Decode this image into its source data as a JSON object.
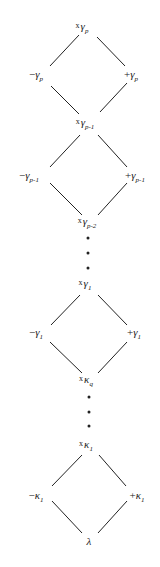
{
  "diagram": {
    "nodes": [
      {
        "id": "x_gamma_p",
        "prefix": "x",
        "symbol": "γ",
        "sub": "p",
        "x": 82,
        "y": 28
      },
      {
        "id": "minus_gamma_p",
        "prefix": "−",
        "symbol": "γ",
        "sub": "p",
        "x": 36,
        "y": 76
      },
      {
        "id": "plus_gamma_p",
        "prefix": "+",
        "symbol": "γ",
        "sub": "p",
        "x": 131,
        "y": 76
      },
      {
        "id": "x_gamma_p-1",
        "prefix": "x",
        "symbol": "γ",
        "sub": "p-1",
        "x": 85,
        "y": 124
      },
      {
        "id": "minus_gamma_p-1",
        "prefix": "−",
        "symbol": "γ",
        "sub": "p-1",
        "x": 29,
        "y": 177
      },
      {
        "id": "plus_gamma_p-1",
        "prefix": "+",
        "symbol": "γ",
        "sub": "p-1",
        "x": 135,
        "y": 177
      },
      {
        "id": "x_gamma_p-2",
        "prefix": "x",
        "symbol": "γ",
        "sub": "p-2",
        "x": 87,
        "y": 223
      },
      {
        "id": "x_gamma_1",
        "prefix": "x",
        "symbol": "γ",
        "sub": "1",
        "x": 85,
        "y": 285
      },
      {
        "id": "minus_gamma_1",
        "prefix": "−",
        "symbol": "γ",
        "sub": "1",
        "x": 36,
        "y": 334
      },
      {
        "id": "plus_gamma_1",
        "prefix": "+",
        "symbol": "γ",
        "sub": "1",
        "x": 134,
        "y": 334
      },
      {
        "id": "x_kappa_q",
        "prefix": "x",
        "symbol": "κ",
        "sub": "q",
        "x": 86,
        "y": 381
      },
      {
        "id": "x_kappa_1",
        "prefix": "x",
        "symbol": "κ",
        "sub": "1",
        "x": 86,
        "y": 446
      },
      {
        "id": "minus_kappa_1",
        "prefix": "−",
        "symbol": "κ",
        "sub": "1",
        "x": 36,
        "y": 497
      },
      {
        "id": "plus_kappa_1",
        "prefix": "+",
        "symbol": "κ",
        "sub": "1",
        "x": 137,
        "y": 497
      },
      {
        "id": "lambda",
        "prefix": "",
        "symbol": "λ",
        "sub": "",
        "x": 89,
        "y": 541
      }
    ],
    "edges": [
      {
        "x1": 79,
        "y1": 35,
        "x2": 50,
        "y2": 66
      },
      {
        "x1": 97,
        "y1": 37,
        "x2": 125,
        "y2": 66
      },
      {
        "x1": 51,
        "y1": 86,
        "x2": 79,
        "y2": 114
      },
      {
        "x1": 127,
        "y1": 83,
        "x2": 100,
        "y2": 112
      },
      {
        "x1": 80,
        "y1": 135,
        "x2": 50,
        "y2": 167
      },
      {
        "x1": 98,
        "y1": 135,
        "x2": 127,
        "y2": 167
      },
      {
        "x1": 50,
        "y1": 183,
        "x2": 82,
        "y2": 215
      },
      {
        "x1": 127,
        "y1": 183,
        "x2": 98,
        "y2": 215
      },
      {
        "x1": 80,
        "y1": 295,
        "x2": 51,
        "y2": 325
      },
      {
        "x1": 98,
        "y1": 295,
        "x2": 127,
        "y2": 325
      },
      {
        "x1": 50,
        "y1": 342,
        "x2": 82,
        "y2": 373
      },
      {
        "x1": 127,
        "y1": 342,
        "x2": 98,
        "y2": 373
      },
      {
        "x1": 82,
        "y1": 455,
        "x2": 52,
        "y2": 486
      },
      {
        "x1": 99,
        "y1": 455,
        "x2": 126,
        "y2": 486
      },
      {
        "x1": 52,
        "y1": 501,
        "x2": 82,
        "y2": 533
      },
      {
        "x1": 127,
        "y1": 501,
        "x2": 98,
        "y2": 533
      }
    ],
    "ellipsis_dots": [
      {
        "x": 88,
        "y": 238
      },
      {
        "x": 88,
        "y": 253
      },
      {
        "x": 88,
        "y": 268
      },
      {
        "x": 89,
        "y": 397
      },
      {
        "x": 89,
        "y": 412
      },
      {
        "x": 89,
        "y": 426
      }
    ],
    "stroke_color": "#222222"
  }
}
